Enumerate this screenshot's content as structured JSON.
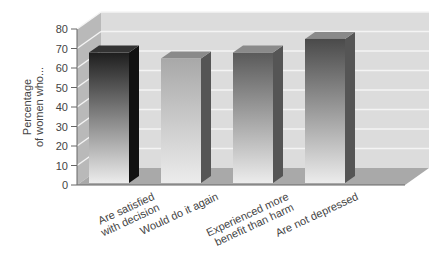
{
  "chart_data": {
    "type": "bar",
    "style": "3d",
    "title": "",
    "ylabel": "Percentage of women who...",
    "ylabel_lines": [
      "Percentage",
      "of women who..."
    ],
    "xlabel": "",
    "ylim": [
      0,
      80
    ],
    "yticks": [
      0,
      10,
      20,
      30,
      40,
      50,
      60,
      70,
      80
    ],
    "grid": true,
    "legend": "none",
    "categories": [
      "Are satisfied with decision",
      "Would do it again",
      "Experienced more benefit than harm",
      "Are not depressed"
    ],
    "category_lines": [
      [
        "Are satisfied",
        "with decision"
      ],
      [
        "Would do it again"
      ],
      [
        "Experienced more",
        "benefit than harm"
      ],
      [
        "Are not depressed"
      ]
    ],
    "values": [
      72,
      69,
      72,
      79
    ],
    "bar_colors": [
      "#1e1e1e",
      "#a8a8a8",
      "#5a5a5a",
      "#4a4a4a"
    ]
  }
}
